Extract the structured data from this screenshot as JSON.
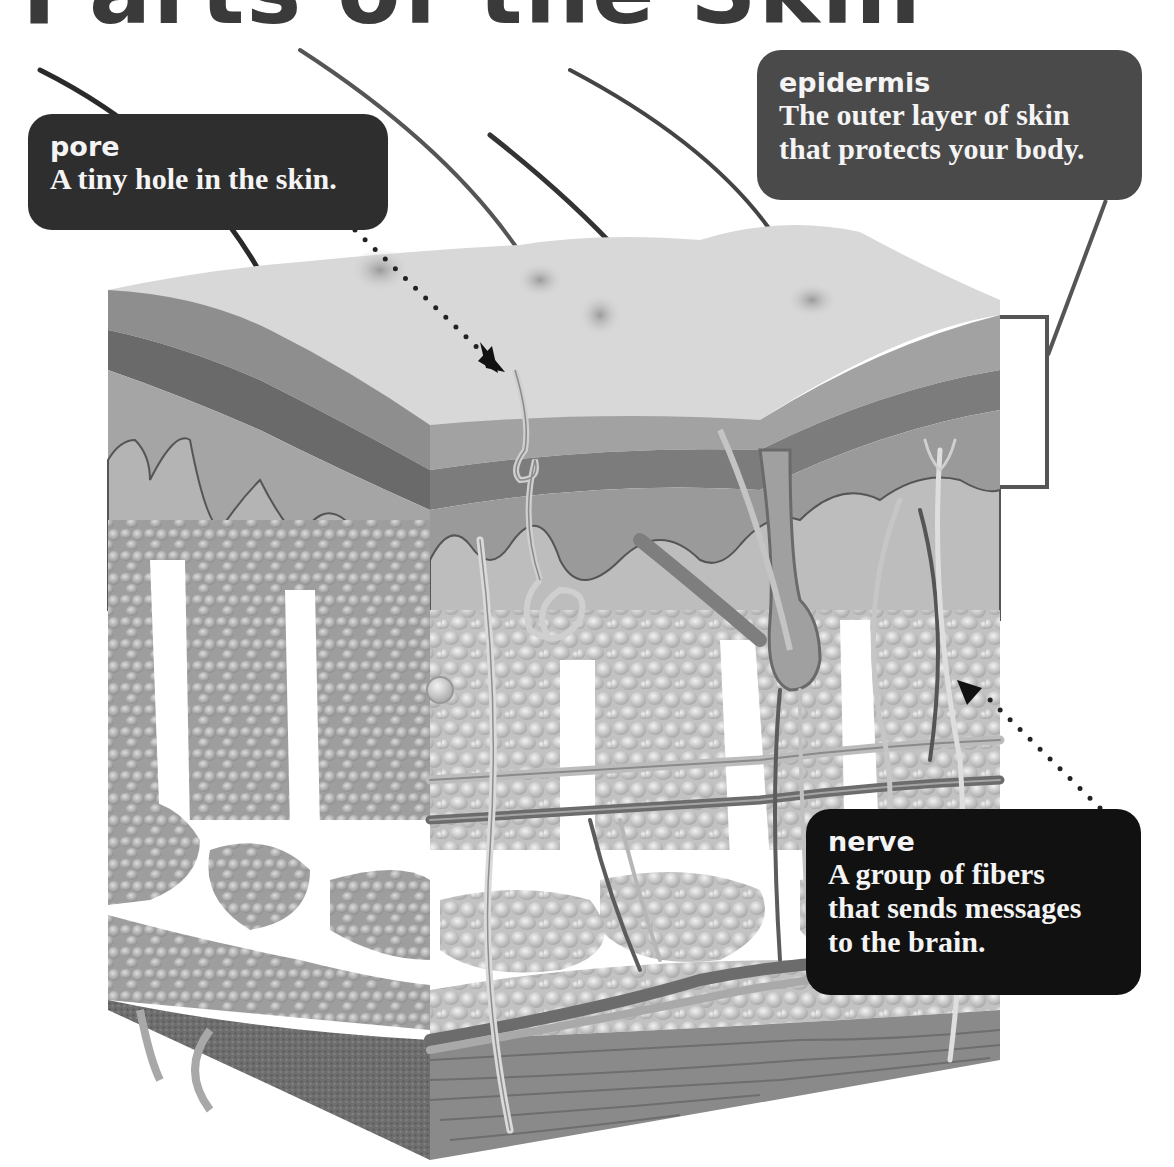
{
  "page": {
    "title": "Parts of the Skin"
  },
  "callouts": {
    "pore": {
      "term": "pore",
      "definition": "A tiny hole in the skin."
    },
    "epidermis": {
      "term": "epidermis",
      "definition_lines": [
        "The outer layer of skin",
        "that protects your body."
      ]
    },
    "nerve": {
      "term": "nerve",
      "definition_lines": [
        "A group of fibers",
        "that sends messages",
        "to the brain."
      ]
    }
  },
  "illustration": {
    "subject": "skin cross-section",
    "elements": [
      "hairs",
      "pores",
      "epidermis layers",
      "sweat gland",
      "hair follicle",
      "arrector pili muscle",
      "fat cells",
      "nerves",
      "blood vessels",
      "muscle tissue"
    ],
    "palette": {
      "surface": "#d8d8d8",
      "layer_mid": "#8e8e8e",
      "layer_dark": "#6a6a6a",
      "dermis": "#b4b4b4",
      "fat": "#c9c9c9",
      "muscle": "#7a7a7a",
      "bracket": "#555555"
    }
  }
}
